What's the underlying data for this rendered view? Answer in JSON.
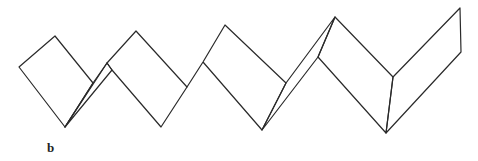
{
  "figure": {
    "label": "b",
    "stroke_color": "#2a2a2a",
    "background": "#ffffff"
  }
}
